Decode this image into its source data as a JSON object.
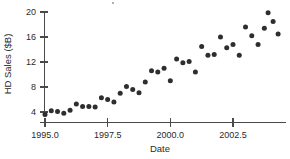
{
  "chart_data": {
    "type": "scatter",
    "title": "",
    "xlabel": "Date",
    "ylabel": "HD Sales ($B)",
    "xlim": [
      1994.6,
      1994.6
    ],
    "ylim": [
      3.0,
      21.0
    ],
    "grid": false,
    "legend": null,
    "xticks": [
      1995.0,
      1997.5,
      2000.0,
      2002.5
    ],
    "xtick_labels": [
      "1995.0",
      "1997.5",
      "2000.0",
      "2002.5"
    ],
    "yticks": [
      4,
      8,
      12,
      16,
      20
    ],
    "ytick_labels": [
      "4",
      "8",
      "12",
      "16",
      "20"
    ],
    "marker": "filled-circle",
    "marker_color": "#2e2e2e",
    "x": [
      1995.0,
      1995.25,
      1995.5,
      1995.75,
      1996.0,
      1996.25,
      1996.5,
      1996.75,
      1997.0,
      1997.25,
      1997.5,
      1997.75,
      1998.0,
      1998.25,
      1998.5,
      1998.75,
      1999.0,
      1999.25,
      1999.5,
      1999.75,
      2000.0,
      2000.25,
      2000.5,
      2000.75,
      2001.0,
      2001.25,
      2001.5,
      2001.75,
      2002.0,
      2002.25,
      2002.5,
      2002.75,
      2003.0,
      2003.25,
      2003.5,
      2003.75
    ],
    "y": [
      3.6,
      4.2,
      4.1,
      3.8,
      4.3,
      5.3,
      4.9,
      4.9,
      4.8,
      6.3,
      6.0,
      5.6,
      7.0,
      8.1,
      7.6,
      7.1,
      8.8,
      10.6,
      10.4,
      11.0,
      9.0,
      12.5,
      11.9,
      12.1,
      10.4,
      14.5,
      13.1,
      13.2,
      16.0,
      14.3,
      14.8,
      13.1,
      17.6,
      16.2,
      14.8,
      17.4
    ],
    "extra_points": {
      "x": [
        2003.9,
        2004.1,
        2004.3
      ],
      "y": [
        19.9,
        18.5,
        16.5
      ]
    },
    "series_name": "HD Sales"
  },
  "axes": {
    "y_label": "HD Sales ($B)",
    "x_label": "Date"
  }
}
